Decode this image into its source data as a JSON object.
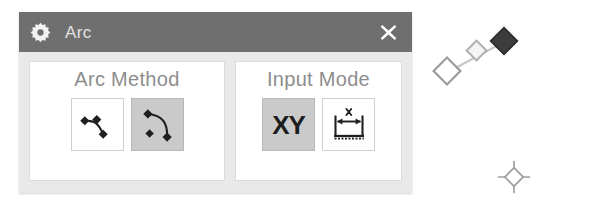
{
  "panel": {
    "title": "Arc",
    "gear_icon": "gear-icon",
    "close_icon": "close-icon",
    "titlebar_color": "#6f6f6f",
    "body_color": "#e9e9e9",
    "groupbox_color": "#ffffff",
    "selected_button_color": "#cacaca",
    "label_color": "#8d8d8d",
    "title_text_color": "#e2e2e2"
  },
  "groups": [
    {
      "id": "arc-method",
      "label": "Arc Method",
      "buttons": [
        {
          "id": "three-point-arc",
          "icon": "three-point-arc-icon",
          "selected": false,
          "tooltip": "Three Point Arc"
        },
        {
          "id": "center-point-arc",
          "icon": "center-point-arc-icon",
          "selected": true,
          "tooltip": "Center Point Arc"
        }
      ]
    },
    {
      "id": "input-mode",
      "label": "Input Mode",
      "buttons": [
        {
          "id": "xy-coordinates",
          "icon": "xy-text-icon",
          "label": "XY",
          "selected": true,
          "tooltip": "XY Coordinates"
        },
        {
          "id": "dimension-input",
          "icon": "dimension-icon",
          "dimension_label": "x",
          "selected": false,
          "tooltip": "Dimension Input"
        }
      ]
    }
  ],
  "canvas": {
    "handle_chain": {
      "name": "arc-handle-chain",
      "handles": [
        {
          "id": "handle-start",
          "style": "outlined-large",
          "selected": false
        },
        {
          "id": "handle-mid",
          "style": "outlined-small",
          "selected": false
        },
        {
          "id": "handle-end",
          "style": "filled-dark",
          "selected": true
        }
      ]
    },
    "snap_marker": {
      "name": "snap-point-marker",
      "style": "diamond-with-ticks"
    }
  }
}
